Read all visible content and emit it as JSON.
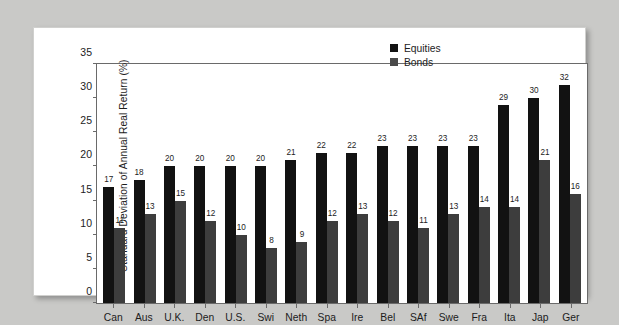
{
  "chart_data": {
    "type": "bar",
    "title": "",
    "xlabel": "",
    "ylabel": "Standard Deviation of Annual Real Return (%)",
    "ylim": [
      0,
      35
    ],
    "yticks": [
      0,
      5,
      10,
      15,
      20,
      25,
      30,
      35
    ],
    "grid": false,
    "legend_position": "top-right",
    "categories": [
      "Can",
      "Aus",
      "U.K.",
      "Den",
      "U.S.",
      "Swi",
      "Neth",
      "Spa",
      "Ire",
      "Bel",
      "SAf",
      "Swe",
      "Fra",
      "Ita",
      "Jap",
      "Ger"
    ],
    "series": [
      {
        "name": "Equities",
        "color": "#121212",
        "values": [
          17,
          18,
          20,
          20,
          20,
          20,
          21,
          22,
          22,
          23,
          23,
          23,
          23,
          29,
          30,
          32
        ]
      },
      {
        "name": "Bonds",
        "color": "#3d3d3d",
        "values": [
          11,
          13,
          15,
          12,
          10,
          8,
          9,
          12,
          13,
          12,
          11,
          13,
          14,
          14,
          21,
          16
        ]
      }
    ]
  },
  "legend": {
    "items": [
      {
        "label": "Equities",
        "swatch": "equities-swatch"
      },
      {
        "label": "Bonds",
        "swatch": "bonds-swatch"
      }
    ]
  },
  "axes": {
    "y_title": "Standard Deviation of Annual Real Return (%)",
    "y_tick_labels": [
      "35",
      "30",
      "25",
      "20",
      "15",
      "10",
      "5",
      "0"
    ]
  }
}
